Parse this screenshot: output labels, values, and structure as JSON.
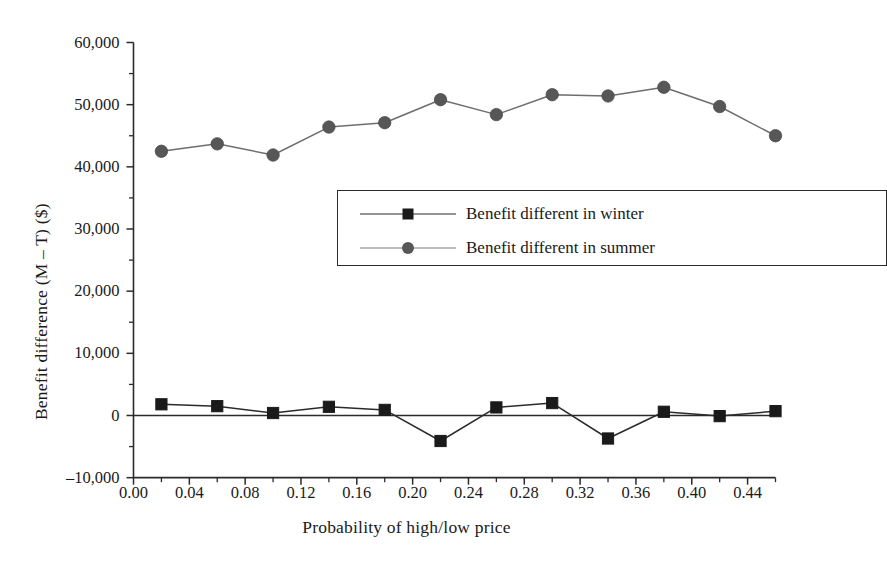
{
  "chart_data": {
    "type": "line",
    "title": "",
    "xlabel": "Probability of high/low price",
    "ylabel": "Benefit difference (M – T) ($)",
    "x": [
      0.02,
      0.06,
      0.1,
      0.14,
      0.18,
      0.22,
      0.26,
      0.3,
      0.34,
      0.38,
      0.42,
      0.46
    ],
    "xlim": [
      0.0,
      0.46
    ],
    "ylim": [
      -10000,
      60000
    ],
    "grid": false,
    "legend_position": "inside-center",
    "xtick_labels": [
      "0.00",
      "0.04",
      "0.08",
      "0.12",
      "0.16",
      "0.20",
      "0.24",
      "0.28",
      "0.32",
      "0.36",
      "0.40",
      "0.44"
    ],
    "xtick_values": [
      0.0,
      0.04,
      0.08,
      0.12,
      0.16,
      0.2,
      0.24,
      0.28,
      0.32,
      0.36,
      0.4,
      0.44
    ],
    "xtick_minor_step": 0.02,
    "ytick_labels": [
      "60,000",
      "50,000",
      "40,000",
      "30,000",
      "20,000",
      "10,000",
      "0",
      "–10,000"
    ],
    "ytick_values": [
      60000,
      50000,
      40000,
      30000,
      20000,
      10000,
      0,
      -10000
    ],
    "ytick_minor_step": 5000,
    "series": [
      {
        "name": "Benefit different in winter",
        "marker": "square",
        "color": "#1a1a1a",
        "line_color": "#2b2b2b",
        "values": [
          1800,
          1500,
          400,
          1400,
          900,
          -4100,
          1300,
          2000,
          -3700,
          600,
          -100,
          700
        ]
      },
      {
        "name": "Benefit different in summer",
        "marker": "circle",
        "color": "#575757",
        "line_color": "#6e6e6e",
        "values": [
          42500,
          43700,
          41900,
          46400,
          47100,
          50800,
          48400,
          51600,
          51400,
          52800,
          49700,
          45000
        ]
      }
    ]
  },
  "legend": {
    "items": [
      {
        "label": "Benefit different in winter",
        "marker": "square-marker",
        "color": "#1a1a1a"
      },
      {
        "label": "Benefit different in summer",
        "marker": "circle-marker",
        "color": "#575757"
      }
    ]
  },
  "colors": {
    "axis": "#2b2b2b",
    "winter": "#1a1a1a",
    "summer": "#616161",
    "background": "#ffffff"
  }
}
